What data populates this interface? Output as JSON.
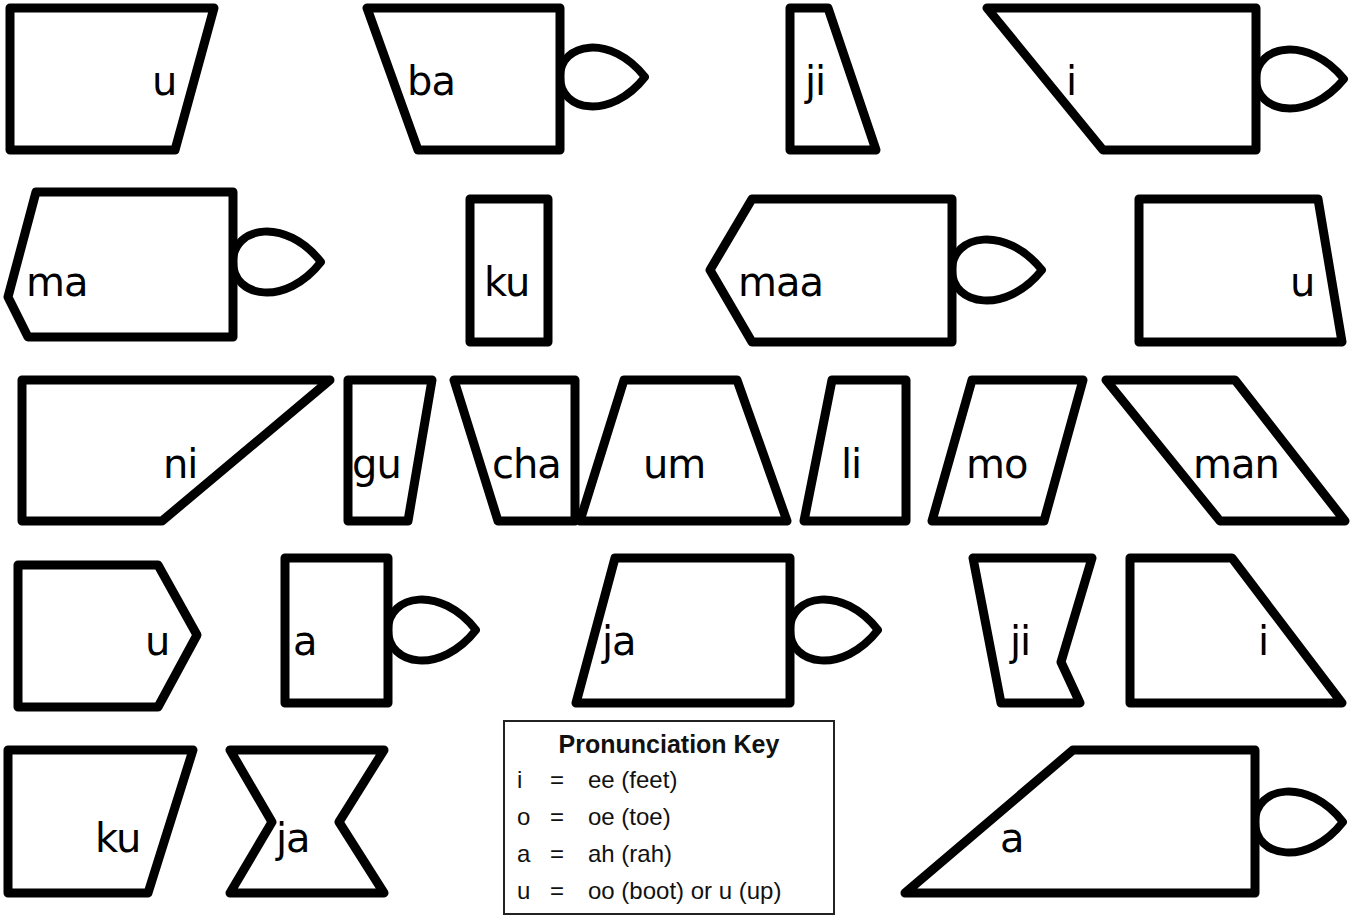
{
  "colors": {
    "stroke": "#000000",
    "fill": "#ffffff",
    "background": "#ffffff"
  },
  "pieces": [
    {
      "id": "r1-u",
      "label": "u",
      "points": "10,8 214,8 175,150 10,150",
      "text_x": 152,
      "text_y": 95,
      "tab": null
    },
    {
      "id": "r1-ba",
      "label": "ba",
      "points": "367,8 560,8 560,150 418,150",
      "text_x": 407,
      "text_y": 95,
      "tab": {
        "x": 560,
        "y": 77,
        "w": 85,
        "h": 58
      }
    },
    {
      "id": "r1-ji",
      "label": "ji",
      "points": "790,8 828,8 876,150 790,150",
      "text_x": 805,
      "text_y": 95,
      "tab": null
    },
    {
      "id": "r1-i",
      "label": "i",
      "points": "987,8 1256,8 1256,150 1103,150",
      "text_x": 1066,
      "text_y": 95,
      "tab": {
        "x": 1256,
        "y": 79,
        "w": 88,
        "h": 58
      }
    },
    {
      "id": "r2-ma",
      "label": "ma",
      "points": "36,192 233,192 233,337 28,337 8,297",
      "text_x": 26,
      "text_y": 296,
      "tab": {
        "x": 233,
        "y": 262,
        "w": 88,
        "h": 60
      }
    },
    {
      "id": "r2-ku",
      "label": "ku",
      "points": "470,199 548,199 548,342 470,342",
      "text_x": 484,
      "text_y": 296,
      "tab": null
    },
    {
      "id": "r2-maa",
      "label": "maa",
      "points": "752,199 952,199 952,342 752,342 710,270",
      "text_x": 738,
      "text_y": 296,
      "tab": {
        "x": 952,
        "y": 270,
        "w": 90,
        "h": 60
      }
    },
    {
      "id": "r2-u",
      "label": "u",
      "points": "1139,199 1318,199 1342,342 1139,342",
      "text_x": 1290,
      "text_y": 296,
      "tab": null
    },
    {
      "id": "r3-ni",
      "label": "ni",
      "points": "22,380 330,380 162,521 22,521",
      "text_x": 163,
      "text_y": 478,
      "tab": null
    },
    {
      "id": "r3-gu",
      "label": "gu",
      "points": "348,380 432,380 408,521 348,521",
      "text_x": 352,
      "text_y": 478,
      "tab": null
    },
    {
      "id": "r3-cha",
      "label": "cha",
      "points": "454,380 575,380 575,521 498,521",
      "text_x": 492,
      "text_y": 478,
      "tab": null
    },
    {
      "id": "r3-um",
      "label": "um",
      "points": "624,380 737,380 787,521 580,521",
      "text_x": 643,
      "text_y": 478,
      "tab": null
    },
    {
      "id": "r3-li",
      "label": "li",
      "points": "832,380 906,380 906,521 804,521",
      "text_x": 841,
      "text_y": 478,
      "tab": null
    },
    {
      "id": "r3-mo",
      "label": "mo",
      "points": "972,380 1083,380 1044,521 932,521",
      "text_x": 966,
      "text_y": 478,
      "tab": null
    },
    {
      "id": "r3-man",
      "label": "man",
      "points": "1106,380 1235,380 1345,521 1220,521",
      "text_x": 1193,
      "text_y": 478,
      "tab": null
    },
    {
      "id": "r4-u",
      "label": "u",
      "points": "18,565 158,565 197,635 158,707 18,707",
      "text_x": 145,
      "text_y": 655,
      "tab": null
    },
    {
      "id": "r4-a",
      "label": "a",
      "points": "285,558 388,558 388,703 285,703",
      "text_x": 293,
      "text_y": 655,
      "tab": {
        "x": 388,
        "y": 630,
        "w": 88,
        "h": 60
      }
    },
    {
      "id": "r4-ja",
      "label": "ja",
      "points": "615,558 790,558 790,703 576,703",
      "text_x": 602,
      "text_y": 655,
      "tab": {
        "x": 790,
        "y": 630,
        "w": 88,
        "h": 60
      }
    },
    {
      "id": "r4-ji",
      "label": "ji",
      "points": "973,558 1092,558 1061,662 1080,703 1001,703",
      "text_x": 1010,
      "text_y": 655,
      "tab": null
    },
    {
      "id": "r4-i",
      "label": "i",
      "points": "1130,558 1232,558 1342,703 1130,703",
      "text_x": 1258,
      "text_y": 655,
      "tab": null
    },
    {
      "id": "r5-ku",
      "label": "ku",
      "points": "8,750 193,750 148,893 8,893",
      "text_x": 95,
      "text_y": 852,
      "tab": null
    },
    {
      "id": "r5-ja",
      "label": "ja",
      "points": "230,750 384,750 339,822 384,893 230,893 272,822",
      "text_x": 276,
      "text_y": 852,
      "tab": null
    },
    {
      "id": "r5-a",
      "label": "a",
      "points": "1073,750 1255,750 1255,893 905,893",
      "text_x": 1000,
      "text_y": 852,
      "tab": {
        "x": 1255,
        "y": 822,
        "w": 88,
        "h": 60
      }
    }
  ],
  "pronunciation_key": {
    "title": "Pronunciation Key",
    "rows": [
      {
        "letter": "i",
        "equals": "=",
        "sound": "ee (feet)"
      },
      {
        "letter": "o",
        "equals": "=",
        "sound": "oe (toe)"
      },
      {
        "letter": "a",
        "equals": "=",
        "sound": "ah (rah)"
      },
      {
        "letter": "u",
        "equals": "=",
        "sound": "oo (boot) or u (up)"
      }
    ]
  }
}
